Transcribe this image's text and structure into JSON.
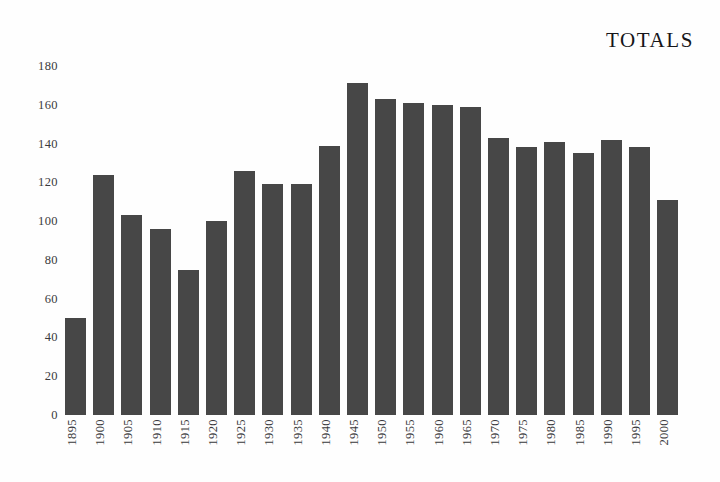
{
  "chart_data": {
    "type": "bar",
    "title": "TOTALS",
    "xlabel": "",
    "ylabel": "",
    "ylim": [
      0,
      180
    ],
    "yticks": [
      0,
      20,
      40,
      60,
      80,
      100,
      120,
      140,
      160,
      180
    ],
    "ytick_labels": [
      "0",
      "20",
      "40",
      "60",
      "80",
      "100",
      "120",
      "140",
      "160",
      "180"
    ],
    "grid": false,
    "legend": null,
    "bar_color": "#474747",
    "background_color": "#ffffff",
    "categories": [
      "1895",
      "1900",
      "1905",
      "1910",
      "1915",
      "1920",
      "1925",
      "1930",
      "1935",
      "1940",
      "1945",
      "1950",
      "1955",
      "1960",
      "1965",
      "1970",
      "1975",
      "1980",
      "1985",
      "1990",
      "1995",
      "2000"
    ],
    "values": [
      50,
      124,
      103,
      96,
      75,
      100,
      126,
      119,
      119,
      139,
      171,
      163,
      161,
      160,
      159,
      143,
      138,
      141,
      135,
      142,
      138,
      111
    ],
    "series": [
      {
        "name": "TOTALS",
        "values": [
          50,
          124,
          103,
          96,
          75,
          100,
          126,
          119,
          119,
          139,
          171,
          163,
          161,
          160,
          159,
          143,
          138,
          141,
          135,
          142,
          138,
          111
        ]
      }
    ]
  }
}
